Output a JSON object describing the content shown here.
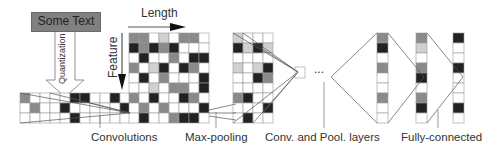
{
  "input_text_box": {
    "label": "Some Text"
  },
  "quantization_label": "Quantization",
  "axis_labels": {
    "length": "Length",
    "feature": "Feature"
  },
  "ellipsis": "...",
  "stage_labels": {
    "convolutions": "Convolutions",
    "max_pooling": "Max-pooling",
    "conv_pool_layers": "Conv. and Pool. layers",
    "fully_connected": "Fully-connected"
  },
  "colors": {
    "dark": "#222222",
    "mid": "#8a8a8a",
    "light": "#d0d0d0",
    "empty": "#ffffff",
    "grid": "#999999"
  },
  "input_grid": [
    [
      2,
      0,
      0,
      0,
      0,
      3,
      3,
      0,
      0,
      3,
      0
    ],
    [
      0,
      2,
      0,
      0,
      3,
      0,
      0,
      0,
      0,
      0,
      3
    ],
    [
      0,
      0,
      0,
      0,
      0,
      3,
      0,
      0,
      0,
      0,
      0
    ]
  ],
  "feature_grid": [
    [
      2,
      2,
      0,
      1,
      0,
      2,
      2,
      0
    ],
    [
      3,
      2,
      3,
      2,
      3,
      0,
      0,
      0
    ],
    [
      0,
      3,
      0,
      0,
      2,
      0,
      3,
      3
    ],
    [
      2,
      0,
      1,
      3,
      0,
      3,
      2,
      0
    ],
    [
      0,
      3,
      0,
      2,
      0,
      0,
      0,
      3
    ],
    [
      0,
      0,
      1,
      0,
      2,
      2,
      0,
      3
    ],
    [
      2,
      0,
      3,
      0,
      0,
      3,
      2,
      0
    ],
    [
      0,
      2,
      0,
      2,
      0,
      0,
      0,
      3
    ],
    [
      0,
      3,
      0,
      0,
      2,
      3,
      3,
      0
    ]
  ],
  "pooled_grid": [
    [
      1,
      0,
      0,
      0
    ],
    [
      3,
      1,
      3,
      1
    ],
    [
      0,
      0,
      0,
      0
    ],
    [
      1,
      0,
      1,
      3
    ],
    [
      0,
      0,
      3,
      2
    ],
    [
      0,
      0,
      0,
      0
    ],
    [
      2,
      3,
      0,
      0
    ],
    [
      0,
      0,
      0,
      3
    ],
    [
      0,
      3,
      0,
      0
    ]
  ],
  "column_a": [
    2,
    3,
    0,
    2,
    0,
    0,
    2,
    0,
    0
  ],
  "column_b": [
    2,
    1,
    0,
    2,
    3,
    0,
    2,
    3,
    0
  ],
  "column_c": [
    3,
    0,
    0,
    3,
    0,
    0,
    0,
    3,
    0
  ]
}
